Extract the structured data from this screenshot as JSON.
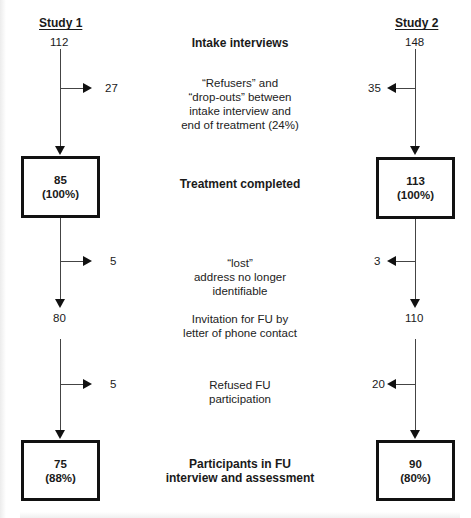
{
  "columns": {
    "study1": {
      "title": "Study 1"
    },
    "study2": {
      "title": "Study 2"
    }
  },
  "stages": [
    {
      "id": "intake",
      "label": "Intake interviews",
      "bold": true,
      "study1": "112",
      "study2": "148"
    },
    {
      "id": "dropouts",
      "label_lines": [
        "“Refusers” and",
        "“drop-outs” between",
        "intake interview and",
        "end of treatment (24%)"
      ],
      "bold": false,
      "study1": "27",
      "study2": "35"
    },
    {
      "id": "treatment",
      "label": "Treatment completed",
      "bold": true,
      "study1": {
        "n": "85",
        "pct": "(100%)"
      },
      "study2": {
        "n": "113",
        "pct": "(100%)"
      }
    },
    {
      "id": "lost",
      "label_lines": [
        "“lost”",
        "address no longer",
        "identifiable"
      ],
      "bold": false,
      "study1": "5",
      "study2": "3"
    },
    {
      "id": "invitation",
      "label_lines": [
        "Invitation for FU by",
        "letter of phone contact"
      ],
      "bold": false,
      "study1": "80",
      "study2": "110"
    },
    {
      "id": "refused",
      "label_lines": [
        "Refused FU",
        "participation"
      ],
      "bold": false,
      "study1": "5",
      "study2": "20"
    },
    {
      "id": "participants",
      "label_lines": [
        "Participants in FU",
        "interview and assessment"
      ],
      "bold": true,
      "study1": {
        "n": "75",
        "pct": "(88%)"
      },
      "study2": {
        "n": "90",
        "pct": "(80%)"
      }
    }
  ],
  "icons": {
    "arrow_down": "down-triangle",
    "arrow_right": "right-triangle",
    "arrow_left": "left-triangle"
  }
}
